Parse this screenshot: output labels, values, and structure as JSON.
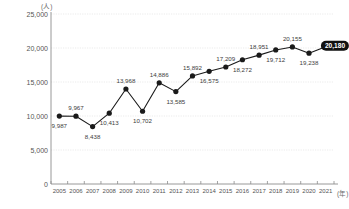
{
  "chart_data": {
    "type": "line",
    "title": "",
    "xlabel": "(年)",
    "ylabel": "(人)",
    "categories": [
      "2005",
      "2006",
      "2007",
      "2008",
      "2009",
      "2010",
      "2011",
      "2012",
      "2013",
      "2014",
      "2015",
      "2016",
      "2017",
      "2018",
      "2019",
      "2020",
      "2021"
    ],
    "values": [
      9987,
      9967,
      8438,
      10413,
      13968,
      10702,
      14886,
      13585,
      15892,
      16575,
      17209,
      18272,
      18951,
      19712,
      20155,
      19238,
      20180
    ],
    "point_labels": [
      "9,987",
      "9,967",
      "8,438",
      "10,413",
      "13,968",
      "10,702",
      "14,886",
      "13,585",
      "15,892",
      "16,575",
      "17,209",
      "18,272",
      "18,951",
      "19,712",
      "20,155",
      "19,238",
      "20,180"
    ],
    "label_positions": [
      "below",
      "above",
      "below",
      "below",
      "above",
      "below",
      "above",
      "below",
      "above",
      "below",
      "above",
      "below",
      "above",
      "below",
      "above",
      "below",
      "badge"
    ],
    "highlight_last": true,
    "highlight_label": "20,180",
    "ylim": [
      0,
      25000
    ],
    "yticks": [
      0,
      5000,
      10000,
      15000,
      20000,
      25000
    ],
    "ytick_labels": [
      "0",
      "5,000",
      "10,000",
      "15,000",
      "20,000",
      "25,000"
    ],
    "grid": true,
    "legend": "none",
    "series_color": "#1a1a1a",
    "grid_color": "#e2e2e2",
    "axis_color": "#8c8c8c"
  }
}
